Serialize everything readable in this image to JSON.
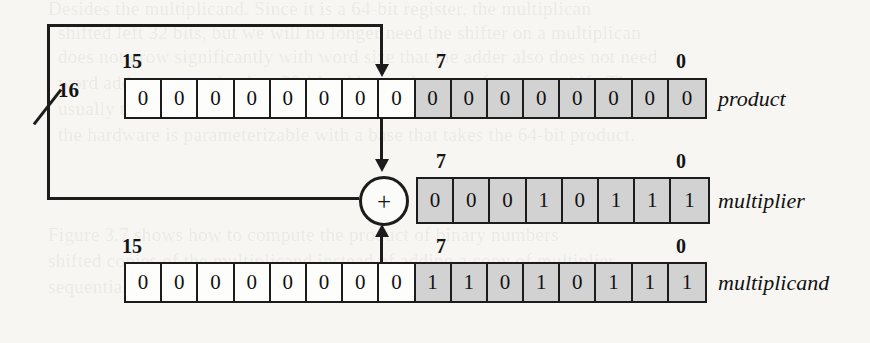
{
  "figure": {
    "bus_width_label": "16",
    "adder_symbol": "+"
  },
  "registers": [
    {
      "name": "product",
      "label_left": "15",
      "label_mid": "7",
      "label_right": "0",
      "bits": [
        "0",
        "0",
        "0",
        "0",
        "0",
        "0",
        "0",
        "0",
        "0",
        "0",
        "0",
        "0",
        "0",
        "0",
        "0",
        "0"
      ],
      "shaded_from_index": 8
    },
    {
      "name": "multiplier",
      "label_mid": "7",
      "label_right": "0",
      "bits": [
        "0",
        "0",
        "0",
        "1",
        "0",
        "1",
        "1",
        "1"
      ],
      "shaded_from_index": 0
    },
    {
      "name": "multiplicand",
      "label_left": "15",
      "label_mid": "7",
      "label_right": "0",
      "bits": [
        "0",
        "0",
        "0",
        "0",
        "0",
        "0",
        "0",
        "0",
        "1",
        "1",
        "0",
        "1",
        "0",
        "1",
        "1",
        "1"
      ],
      "shaded_from_index": 8
    }
  ],
  "background_text": {
    "lines": [
      "Desides the multiplicand. Since it is a 64-bit register, the multiplican",
      "shifted left 32 bits, but we will no longer need the shifter on a multiplican",
      "does not grow significantly with word size that the adder also does not need",
      "word adder; we need only a 32-bit adder, at the cost of an extra shift. The",
      "usually turns out to be the most critical component in a hardware design.",
      "the hardware is parameterizable with a base that takes the 64-bit product.",
      "",
      "Figure 3.7 shows how to compute the product of binary numbers",
      "shifted copies of the multiplicand instead of adding a copy of multiplier.",
      "sequential behavior of the circuit in that iteration that per iteration, the sum"
    ]
  }
}
